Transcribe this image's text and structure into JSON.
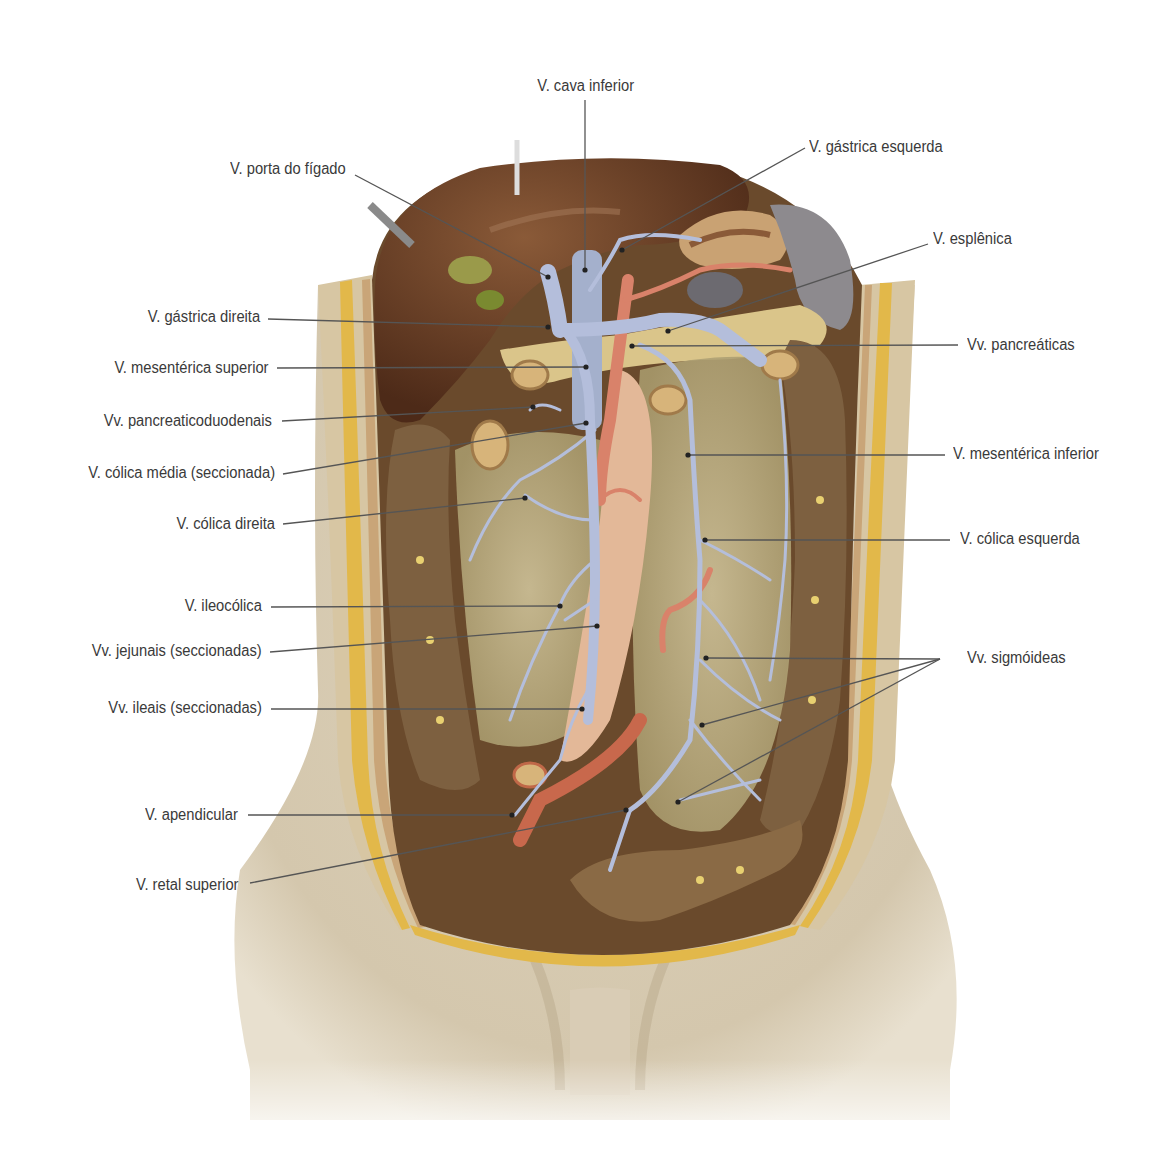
{
  "figure": {
    "colors": {
      "vein": "#b4bedb",
      "artery": "#d9826a",
      "skin": "#d8ccb4",
      "liver": "#6b3d24",
      "fat_layer": "#e2b84a",
      "mesentery": "#c9bd8e",
      "colon": "#8a6a45",
      "label_text": "#3a3a3a",
      "leader_line": "#555555"
    }
  },
  "labels": {
    "cava_inferior": "V. cava inferior",
    "porta_figado": "V. porta do fígado",
    "gastrica_esquerda": "V. gástrica esquerda",
    "esplenica": "V. esplênica",
    "gastrica_direita": "V. gástrica direita",
    "pancreaticas": "Vv. pancreáticas",
    "mesenterica_superior": "V. mesentérica superior",
    "pancreaticoduodenais": "Vv. pancreaticoduodenais",
    "colica_media": "V. cólica média (seccionada)",
    "mesenterica_inferior": "V. mesentérica inferior",
    "colica_direita": "V. cólica direita",
    "colica_esquerda": "V. cólica esquerda",
    "ileocolica": "V. ileocólica",
    "sigmoideas": "Vv. sigmóideas",
    "jejunais": "Vv. jejunais (seccionadas)",
    "ileais": "Vv. ileais (seccionadas)",
    "apendicular": "V. apendicular",
    "retal_superior": "V. retal superior"
  }
}
